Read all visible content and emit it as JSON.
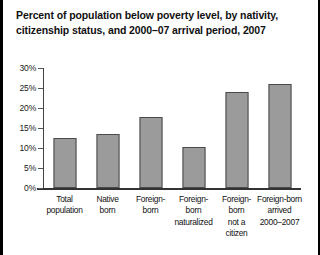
{
  "title": "Percent of population below poverty level, by nativity, citizenship status, and 2000–07 arrival period, 2007",
  "colors": {
    "bar_fill": "#9b9b9b",
    "bar_border": "#4a4a4a",
    "axis": "#333333",
    "text": "#111111",
    "frame": "#000000"
  },
  "chart_data": {
    "type": "bar",
    "title": "Percent of population below poverty level, by nativity, citizenship status, and 2000–07 arrival period, 2007",
    "xlabel": "",
    "ylabel": "",
    "ylim": [
      0,
      30
    ],
    "grid": false,
    "legend": false,
    "ytick_labels": [
      "0%",
      "5%",
      "10%",
      "15%",
      "20%",
      "25%",
      "30%"
    ],
    "ytick_values": [
      0,
      5,
      10,
      15,
      20,
      25,
      30
    ],
    "categories": [
      "Total population",
      "Native born",
      "Foreign-born",
      "Foreign-born naturalized",
      "Foreign-born not a citizen",
      "Foreign-born arrived 2000–2007"
    ],
    "category_lines": [
      [
        "Total",
        "population"
      ],
      [
        "Native",
        "born"
      ],
      [
        "Foreign-",
        "born"
      ],
      [
        "Foreign-",
        "born",
        "naturalized"
      ],
      [
        "Foreign-",
        "born",
        "not a",
        "citizen"
      ],
      [
        "Foreign-born",
        "arrived",
        "2000–2007"
      ]
    ],
    "values": [
      12.5,
      13.5,
      17.8,
      10.2,
      24.0,
      26.0
    ]
  }
}
